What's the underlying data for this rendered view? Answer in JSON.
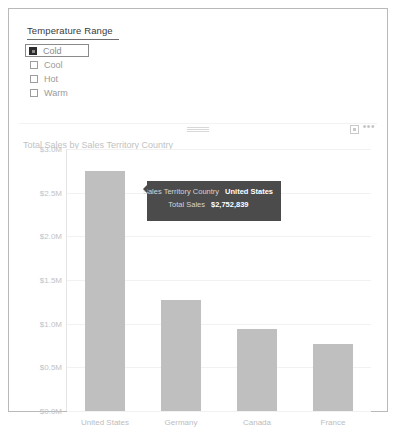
{
  "page": {
    "background": "#ffffff",
    "border_color": "#b9b9b9"
  },
  "slicer": {
    "title": "Temperature Range",
    "items": [
      {
        "label": "Cold",
        "checked": true,
        "focused": true
      },
      {
        "label": "Cool",
        "checked": false,
        "focused": false
      },
      {
        "label": "Hot",
        "checked": false,
        "focused": false
      },
      {
        "label": "Warm",
        "checked": false,
        "focused": false
      }
    ]
  },
  "chart_visual": {
    "title": "Total Sales by Sales Territory Country",
    "header_icons": {
      "drag_handle": "drag-handle-icon",
      "focus_mode": "focus-mode-icon",
      "more_options": "•••"
    }
  },
  "tooltip": {
    "visible": true,
    "background": "#4b4b4b",
    "rows": [
      {
        "key": "Sales Territory Country",
        "value": "United States"
      },
      {
        "key": "Total Sales",
        "value": "$2,752,839"
      }
    ]
  },
  "chart_data": {
    "type": "bar",
    "title": "Total Sales by Sales Territory Country",
    "xlabel": "",
    "ylabel": "",
    "categories": [
      "United States",
      "Germany",
      "Canada",
      "France"
    ],
    "values": [
      2752839,
      1270000,
      940000,
      770000
    ],
    "value_labels": [
      "$2,752,839",
      "$1.27M",
      "$0.94M",
      "$0.77M"
    ],
    "ylim": [
      0,
      3000000
    ],
    "ytick_values": [
      0,
      500000,
      1000000,
      1500000,
      2000000,
      2500000,
      3000000
    ],
    "ytick_labels": [
      "$0.0M",
      "$0.5M",
      "$1.0M",
      "$1.5M",
      "$2.0M",
      "$2.5M",
      "$3.0M"
    ],
    "bar_color": "#bfbfbf",
    "grid": true,
    "grid_color": "#f1f1f1",
    "legend": "none",
    "highlighted_category": "United States"
  }
}
